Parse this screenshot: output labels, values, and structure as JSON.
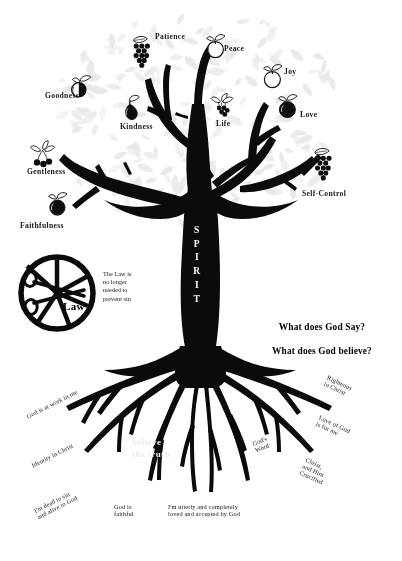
{
  "page": {
    "width": 402,
    "height": 561,
    "background_color": "#ffffff",
    "ink_color": "#000000",
    "leaf_tint": "#ebe9e7"
  },
  "trunk": {
    "word": "SPIRIT",
    "letters": [
      "S",
      "P",
      "I",
      "R",
      "I",
      "T"
    ],
    "text_color": "#ffffff"
  },
  "fruits": [
    {
      "label": "Patience",
      "icon": "grapes-icon",
      "fill": "dark"
    },
    {
      "label": "Peace",
      "icon": "apple-icon",
      "fill": "light"
    },
    {
      "label": "Joy",
      "icon": "apple-icon",
      "fill": "light"
    },
    {
      "label": "Goodness",
      "icon": "half-apple-icon",
      "fill": "half"
    },
    {
      "label": "Kindness",
      "icon": "pear-icon",
      "fill": "dark"
    },
    {
      "label": "Life",
      "icon": "berries-icon",
      "fill": "dark"
    },
    {
      "label": "Love",
      "icon": "apple-icon",
      "fill": "dark"
    },
    {
      "label": "Gentleness",
      "icon": "cherries-icon",
      "fill": "dark"
    },
    {
      "label": "Self-Control",
      "icon": "grapes-icon",
      "fill": "dark"
    },
    {
      "label": "Faithfulness",
      "icon": "apple-icon",
      "fill": "dark"
    }
  ],
  "law_badge": {
    "word": "Law",
    "icon": "scissors-cutting-circle-icon",
    "note": "The Law is\nno longer\nneeded to\nprevent sin"
  },
  "question_block": {
    "line1": "What does God Say?",
    "line2": "What does God believe?"
  },
  "roots": [
    {
      "label": "God is at work in me",
      "rotate": -27
    },
    {
      "label": "Identity in Christ",
      "rotate": -27
    },
    {
      "label": "I'm dead to sin\nand alive to God",
      "rotate": -27
    },
    {
      "label": "God is\nfaithful",
      "rotate": 0
    },
    {
      "label": "I'm utterly and completely\nloved and accepted by God",
      "rotate": 0
    },
    {
      "label": "God's\nWord",
      "rotate": -22
    },
    {
      "label": "Righteous\nin Christ",
      "rotate": 25
    },
    {
      "label": "Love of God\nis for me",
      "rotate": 25
    },
    {
      "label": "Christ,\nand Him\nCrucified",
      "rotate": 25
    }
  ],
  "watermark": {
    "text": "believe\nthe truth"
  }
}
